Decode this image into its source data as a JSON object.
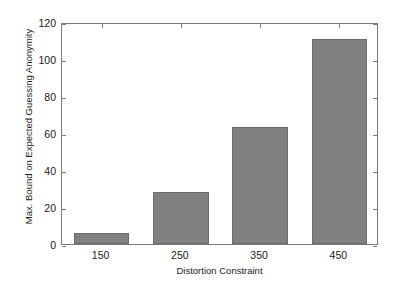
{
  "chart_data": {
    "type": "bar",
    "title": "",
    "subtitle": "",
    "xlabel": "Distortion Constraint",
    "ylabel": "Max. Bound on Expected Guessing Anonymity",
    "categories": [
      "150",
      "250",
      "350",
      "450"
    ],
    "values": [
      6,
      28,
      63,
      111
    ],
    "series": [
      {
        "name": "Max. Bound on Expected Guessing Anonymity",
        "values": [
          6,
          28,
          63,
          111
        ]
      }
    ],
    "ylim": [
      0,
      120
    ],
    "y_ticks": [
      "0",
      "20",
      "40",
      "60",
      "80",
      "100",
      "120"
    ],
    "y_tick_values": [
      0,
      20,
      40,
      60,
      80,
      100,
      120
    ],
    "x_ticks": [
      "150",
      "250",
      "350",
      "450"
    ],
    "grid": false,
    "legend": false,
    "legend_position": "none",
    "bar_color": "#808080",
    "bar_edge_color": "#6b6b6b",
    "axis_color": "#7a7a7a",
    "background_color": "#ffffff",
    "text_color": "#1a1a1a"
  }
}
